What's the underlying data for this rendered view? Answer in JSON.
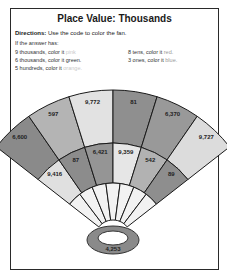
{
  "fragment": "",
  "worksheet": {
    "title": "Place Value: Thousands",
    "directions_label": "Directions:",
    "directions_text": "Use the code to color the fan.",
    "intro": "If the answer has:",
    "rules": [
      {
        "prefix": "9 thousands, color it",
        "color_word": "pink"
      },
      {
        "prefix": "6 thousands, color it",
        "color_word": "green."
      },
      {
        "prefix": "5 hundreds, color it",
        "color_word": "orange."
      },
      {
        "prefix": "8 tens, color it",
        "color_word": "red."
      },
      {
        "prefix": "3 ones, color it",
        "color_word": "blue."
      }
    ],
    "fan": {
      "outer_ring": [
        "6,600",
        "597",
        "9,772",
        "81",
        "6,370",
        "9,727"
      ],
      "middle_ring": [
        "9,416",
        "87",
        "6,421",
        "9,359",
        "542",
        "89"
      ],
      "handle": "4,253"
    }
  }
}
